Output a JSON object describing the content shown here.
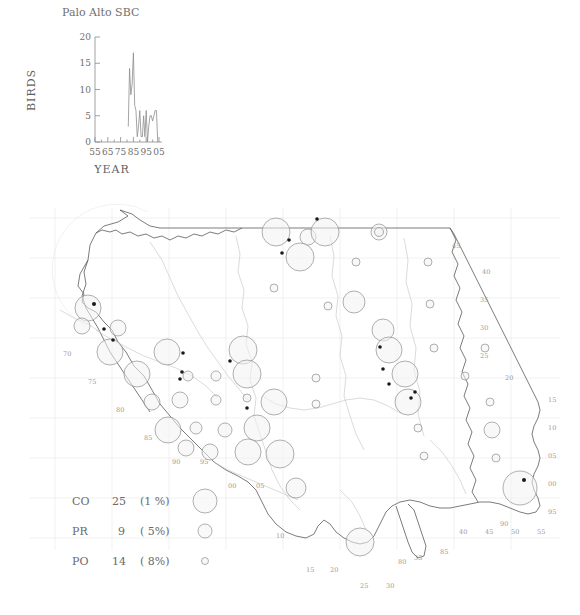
{
  "figure": {
    "name": "palo-alto-sbc-bird-distribution-figure"
  },
  "timeseries": {
    "title": "Palo Alto SBC",
    "xlabel": "YEAR",
    "ylabel": "BIRDS"
  },
  "chart_data": {
    "type": "line",
    "title": "Palo Alto SBC",
    "xlabel": "YEAR",
    "ylabel": "BIRDS",
    "xlim": [
      55,
      107
    ],
    "ylim": [
      0,
      20
    ],
    "xticks": [
      "55",
      "65",
      "75",
      "85",
      "95",
      "05"
    ],
    "xtick_values": [
      55,
      65,
      75,
      85,
      95,
      105
    ],
    "yticks": [
      "0",
      "5",
      "10",
      "15",
      "20"
    ],
    "ytick_values": [
      0,
      5,
      10,
      15,
      20
    ],
    "grid": false,
    "legend": "none",
    "series": [
      {
        "name": "BIRDS",
        "x": [
          81,
          82,
          83,
          84,
          85,
          86,
          87,
          88,
          89,
          90,
          91,
          92,
          93,
          94,
          95,
          96,
          97,
          98,
          99,
          100,
          101,
          102,
          103,
          104
        ],
        "values": [
          3,
          14,
          9,
          11,
          17,
          7,
          6,
          1,
          3,
          6,
          1,
          1,
          5,
          1,
          6,
          0,
          3,
          5,
          5,
          4,
          5,
          6,
          6,
          0
        ]
      }
    ]
  },
  "map": {
    "name": "us-distribution-map",
    "edge_labels_right": [
      "45",
      "40",
      "35",
      "30",
      "25",
      "20",
      "15",
      "10",
      "05",
      "00",
      "95"
    ],
    "edge_labels_bottom": [
      "15",
      "20",
      "25",
      "30",
      "35",
      "40",
      "45",
      "50",
      "55"
    ],
    "edge_labels_bottom_secondary": [
      "85",
      "80",
      "90"
    ],
    "edge_labels_left": [
      "70",
      "75",
      "80",
      "85",
      "90",
      "95",
      "00",
      "05"
    ]
  },
  "legend": {
    "name": "symbol-size-legend",
    "rows": [
      {
        "code": "CO",
        "count": "25",
        "pct": "(1 %)",
        "size": "large"
      },
      {
        "code": "PR",
        "count": "9",
        "pct": "( 5%)",
        "size": "medium"
      },
      {
        "code": "PO",
        "count": "14",
        "pct": "( 8%)",
        "size": "small"
      }
    ]
  },
  "colors": {
    "line": "#8d8d8d",
    "coast": "#5b5b5b",
    "river": "#c3c3c3",
    "grid": "#e2e2e2",
    "circle_stroke": "#8e8e8e",
    "dot": "#1a1a1a",
    "text": "#6a6a6a"
  }
}
